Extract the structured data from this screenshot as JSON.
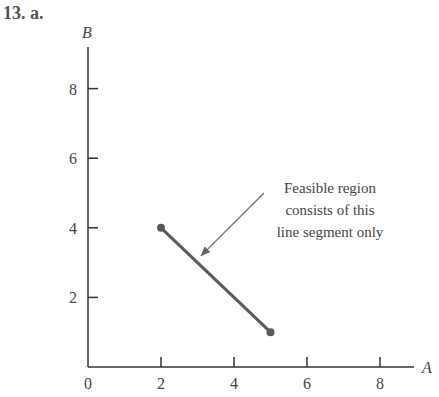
{
  "problem_label": "13. a.",
  "colors": {
    "axis": "#333333",
    "segment": "#5a5a5a",
    "arrow": "#666666",
    "text": "#444444"
  },
  "chart_data": {
    "type": "line",
    "title": "",
    "xlabel": "A",
    "ylabel": "B",
    "xlim": [
      0,
      9
    ],
    "ylim": [
      0,
      9
    ],
    "x_ticks": [
      2,
      4,
      6,
      8
    ],
    "x_tick_labels": [
      "0",
      "2",
      "4",
      "6",
      "8"
    ],
    "y_ticks": [
      2,
      4,
      6,
      8
    ],
    "y_tick_labels": [
      "2",
      "4",
      "6",
      "8"
    ],
    "grid": false,
    "legend": null,
    "series": [
      {
        "name": "feasible-segment",
        "x": [
          2,
          5
        ],
        "y": [
          4,
          1
        ],
        "markers": "endpoints"
      }
    ],
    "annotations": [
      {
        "text_lines": [
          "Feasible region",
          "consists of this",
          "line segment only"
        ],
        "arrow_to": [
          3.1,
          3.2
        ]
      }
    ]
  }
}
